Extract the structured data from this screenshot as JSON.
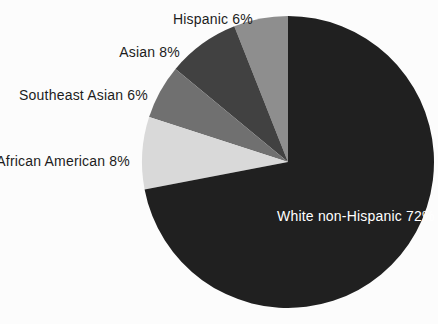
{
  "chart_data": {
    "type": "pie",
    "title": "",
    "labels": [
      "Hispanic",
      "Asian",
      "Southeast Asian",
      "African American",
      "White non-Hispanic"
    ],
    "values": [
      6,
      8,
      6,
      8,
      72
    ],
    "display_labels": [
      "Hispanic 6%",
      "Asian 8%",
      "Southeast Asian 6%",
      "African American 8%",
      "White non-Hispanic 72%"
    ],
    "colors": [
      "#8e8e8e",
      "#414141",
      "#707070",
      "#d9d9d9",
      "#202020"
    ],
    "start_angle_deg": 90,
    "direction": "counterclockwise",
    "legend_position": "none",
    "label_style": {
      "outside_text_color": "#1c1c1c",
      "inside_text_color": "#ffffff"
    },
    "background_color": "#fcfcfc"
  }
}
